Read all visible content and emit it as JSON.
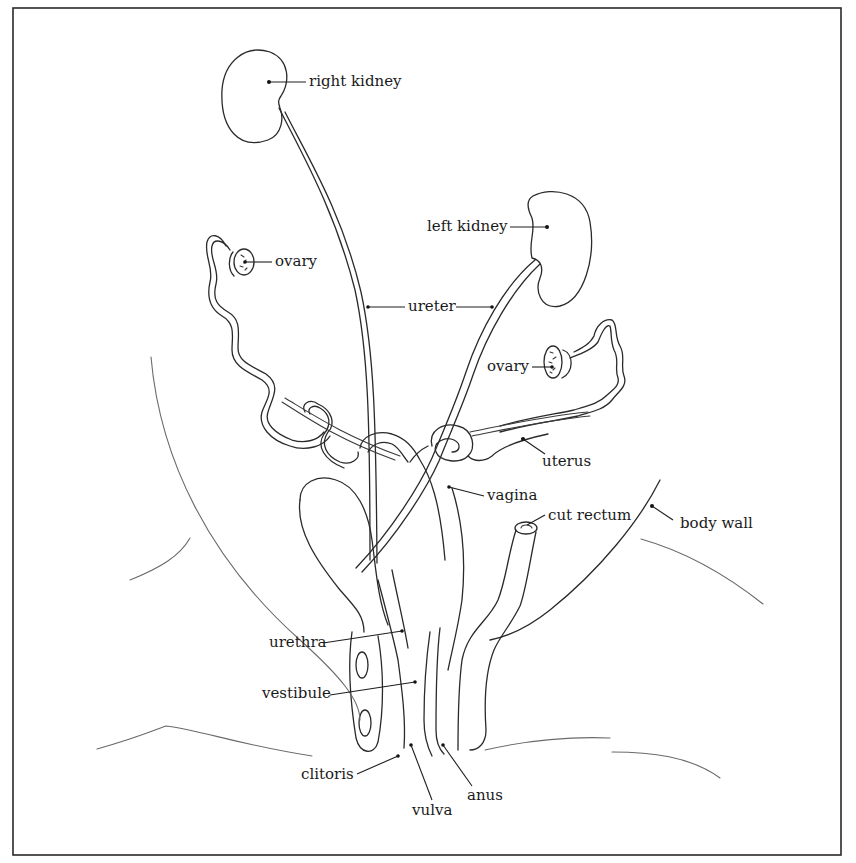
{
  "figure": {
    "type": "anatomical line drawing",
    "frame_color": "#2a2a2a",
    "line_color": "#2a2a2a",
    "background": "#ffffff"
  },
  "labels": {
    "right_kidney": "right kidney",
    "left_kidney": "left kidney",
    "ovary_left": "ovary",
    "ovary_right": "ovary",
    "ureter": "ureter",
    "uterus": "uterus",
    "vagina": "vagina",
    "cut_rectum": "cut rectum",
    "body_wall": "body wall",
    "urethra": "urethra",
    "vestibule": "vestibule",
    "clitoris": "clitoris",
    "vulva": "vulva",
    "anus": "anus"
  }
}
